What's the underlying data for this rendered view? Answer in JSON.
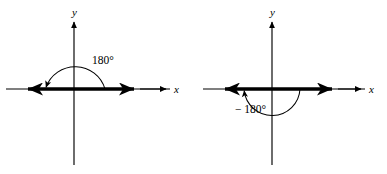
{
  "figure": {
    "background_color": "#ffffff",
    "stroke_color": "#000000",
    "panels": [
      {
        "id": "panel-left",
        "axis_label_x": "x",
        "axis_label_y": "y",
        "angle_label": "180°",
        "angle_degrees": 180,
        "rotation_direction": "counterclockwise",
        "arc_position": "above-x-axis",
        "origin": {
          "x": 74,
          "y": 89
        },
        "terminal_side": "negative-x-axis",
        "initial_side": "positive-x-axis"
      },
      {
        "id": "panel-right",
        "axis_label_x": "x",
        "axis_label_y": "y",
        "angle_label": "− 180°",
        "angle_degrees": -180,
        "rotation_direction": "clockwise",
        "arc_position": "below-x-axis",
        "origin": {
          "x": 79,
          "y": 89
        },
        "terminal_side": "negative-x-axis",
        "initial_side": "positive-x-axis"
      }
    ]
  }
}
